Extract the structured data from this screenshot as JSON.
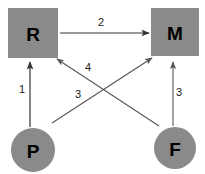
{
  "diagram": {
    "type": "node-link-diagram",
    "width": 205,
    "height": 174,
    "background_color": "#ffffff",
    "node_fill_color": "#8a8a8a",
    "node_text_color": "#000000",
    "edge_color": "#555555",
    "edge_label_color": "#1a1a1a",
    "nodes": [
      {
        "id": "R",
        "label": "R",
        "shape": "square",
        "x": 33,
        "y": 33,
        "size": 50
      },
      {
        "id": "M",
        "label": "M",
        "shape": "square",
        "x": 175,
        "y": 32,
        "size": 48
      },
      {
        "id": "P",
        "label": "P",
        "shape": "circle",
        "x": 33,
        "y": 150,
        "size": 44
      },
      {
        "id": "F",
        "label": "F",
        "shape": "circle",
        "x": 175,
        "y": 148,
        "size": 42
      }
    ],
    "edges": [
      {
        "id": "edge-p-to-r",
        "from": "P",
        "to": "R",
        "label": "1",
        "label_x": 22,
        "label_y": 89
      },
      {
        "id": "edge-r-to-m",
        "from": "R",
        "to": "M",
        "label": "2",
        "label_x": 101,
        "label_y": 22
      },
      {
        "id": "edge-f-to-m",
        "from": "F",
        "to": "M",
        "label": "3",
        "label_x": 179,
        "label_y": 92
      },
      {
        "id": "edge-p-to-m",
        "from": "P",
        "to": "M",
        "label": "3",
        "label_x": 78,
        "label_y": 94
      },
      {
        "id": "edge-f-to-r",
        "from": "F",
        "to": "R",
        "label": "4",
        "label_x": 88,
        "label_y": 67
      }
    ]
  }
}
